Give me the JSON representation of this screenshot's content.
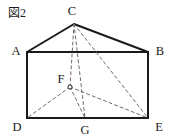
{
  "figure": {
    "caption": "図2",
    "caption_pos": {
      "x": 8,
      "y": 7
    },
    "background_color": "#ffffff",
    "solid_stroke_color": "#1a1a1a",
    "dashed_stroke_color": "#6b6b6b",
    "label_color": "#1c1c1c",
    "solid_stroke_width": 2.0,
    "dashed_stroke_width": 1.0,
    "dash_pattern": "3,3"
  },
  "vertices": [
    {
      "id": "A",
      "label": "A",
      "x": 27,
      "y": 52,
      "label_x": 16,
      "label_y": 51,
      "marker": false
    },
    {
      "id": "B",
      "label": "B",
      "x": 148,
      "y": 52,
      "label_x": 160,
      "label_y": 51,
      "marker": false
    },
    {
      "id": "C",
      "label": "C",
      "x": 74,
      "y": 24,
      "label_x": 72,
      "label_y": 11,
      "marker": false
    },
    {
      "id": "D",
      "label": "D",
      "x": 27,
      "y": 118,
      "label_x": 17,
      "label_y": 127,
      "marker": false
    },
    {
      "id": "E",
      "label": "E",
      "x": 148,
      "y": 118,
      "label_x": 159,
      "label_y": 127,
      "marker": false
    },
    {
      "id": "F",
      "label": "F",
      "x": 70,
      "y": 87,
      "label_x": 61,
      "label_y": 79,
      "marker": true
    },
    {
      "id": "G",
      "label": "G",
      "x": 85,
      "y": 118,
      "label_x": 85,
      "label_y": 130,
      "marker": false
    }
  ],
  "solid_edges": [
    {
      "name": "edge-A-C",
      "from": "A",
      "to": "C"
    },
    {
      "name": "edge-C-B",
      "from": "C",
      "to": "B"
    },
    {
      "name": "edge-A-B",
      "from": "A",
      "to": "B"
    },
    {
      "name": "edge-A-D",
      "from": "A",
      "to": "D"
    },
    {
      "name": "edge-B-E",
      "from": "B",
      "to": "E"
    },
    {
      "name": "edge-D-E",
      "from": "D",
      "to": "E"
    }
  ],
  "dashed_edges": [
    {
      "name": "edge-C-F",
      "from": "C",
      "to": "F"
    },
    {
      "name": "edge-C-G",
      "from": "C",
      "to": "G"
    },
    {
      "name": "edge-C-E",
      "from": "C",
      "to": "E"
    },
    {
      "name": "edge-F-D",
      "from": "F",
      "to": "D"
    },
    {
      "name": "edge-F-E",
      "from": "F",
      "to": "E"
    },
    {
      "name": "edge-F-G",
      "from": "F",
      "to": "G"
    }
  ]
}
